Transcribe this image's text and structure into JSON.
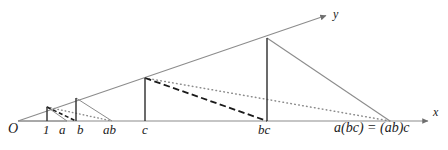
{
  "figure": {
    "background_color": "#ffffff",
    "width": 448,
    "height": 150,
    "colors": {
      "solid_line": "#8c8c8c",
      "vertical_line": "#3a3a3a",
      "dashed_line": "#1a1a1a",
      "dotted_line": "#8c8c8c",
      "text": "#1a1a1a"
    }
  },
  "axes": {
    "x_label": "x",
    "y_label": "y",
    "origin_label": "O",
    "x_axis_tip": {
      "x": 432,
      "y": 121
    },
    "y_axis_tip": {
      "x": 330,
      "y": 14
    },
    "origin": {
      "x": 18,
      "y": 121
    }
  },
  "tick_labels": [
    {
      "id": "origin",
      "text": "O",
      "x": 10,
      "y": 126
    },
    {
      "id": "one",
      "text": "1",
      "x": 44,
      "y": 127
    },
    {
      "id": "a",
      "text": "a",
      "x": 60,
      "y": 127
    },
    {
      "id": "b",
      "text": "b",
      "x": 78,
      "y": 127
    },
    {
      "id": "ab",
      "text": "ab",
      "x": 105,
      "y": 127
    },
    {
      "id": "c",
      "text": "c",
      "x": 143,
      "y": 127
    },
    {
      "id": "bc",
      "text": "bc",
      "x": 260,
      "y": 127
    },
    {
      "id": "abc",
      "text": "a(bc) = (ab)c",
      "x": 337,
      "y": 126
    }
  ],
  "verticals": [
    {
      "id": "v-one",
      "label": "1",
      "x": 47,
      "y_bottom": 121,
      "y_top": 107
    },
    {
      "id": "v-b",
      "label": "b",
      "x": 76,
      "y_bottom": 121,
      "y_top": 98
    },
    {
      "id": "v-c",
      "label": "c",
      "x": 145,
      "y_bottom": 121,
      "y_top": 78
    },
    {
      "id": "v-bc",
      "label": "bc",
      "x": 267,
      "y_bottom": 121,
      "y_top": 38
    }
  ],
  "solid_rays": [
    {
      "id": "ray-small-1",
      "from_x": 18,
      "from_y": 121,
      "to_x": 67,
      "to_y": 121
    },
    {
      "id": "ray-small-2",
      "from_x": 47,
      "from_y": 107,
      "to_x": 67,
      "to_y": 121
    },
    {
      "id": "ray-mid",
      "from_x": 76,
      "from_y": 98,
      "to_x": 112,
      "to_y": 121
    },
    {
      "id": "ray-big",
      "from_x": 267,
      "from_y": 38,
      "to_x": 390,
      "to_y": 121
    }
  ],
  "dashed_lines": [
    {
      "id": "dash-small",
      "from_x": 47,
      "from_y": 107,
      "to_x": 76,
      "to_y": 121
    },
    {
      "id": "dash-large",
      "from_x": 145,
      "from_y": 78,
      "to_x": 267,
      "to_y": 121
    }
  ],
  "dotted_lines": [
    {
      "id": "dot-small",
      "from_x": 47,
      "from_y": 107,
      "to_x": 112,
      "to_y": 121
    },
    {
      "id": "dot-large",
      "from_x": 145,
      "from_y": 78,
      "to_x": 390,
      "to_y": 121
    }
  ]
}
